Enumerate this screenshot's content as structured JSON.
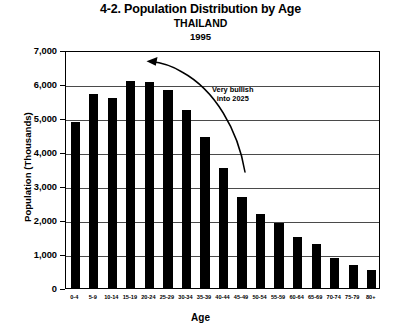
{
  "chart_data": {
    "type": "bar",
    "title": "4-2. Population Distribution by Age",
    "subtitle": "THAILAND",
    "subtitle2": "1995",
    "xlabel": "Age",
    "ylabel": "Population (Thousands)",
    "ylim": [
      0,
      7000
    ],
    "ytick_labels": [
      "7,000",
      "6,000",
      "5,000",
      "4,000",
      "3,000",
      "2,000",
      "1,000",
      "0"
    ],
    "ytick_values": [
      7000,
      6000,
      5000,
      4000,
      3000,
      2000,
      1000,
      0
    ],
    "grid": true,
    "legend": "none",
    "categories": [
      "0-4",
      "5-9",
      "10-14",
      "15-19",
      "20-24",
      "25-29",
      "30-34",
      "35-39",
      "40-44",
      "45-49",
      "50-54",
      "55-59",
      "60-64",
      "65-69",
      "70-74",
      "75-79",
      "80+"
    ],
    "values": [
      4880,
      5700,
      5580,
      6080,
      6050,
      5830,
      5250,
      4430,
      3520,
      2680,
      2180,
      1900,
      1500,
      1280,
      880,
      690,
      540
    ],
    "bar_color": "#000000",
    "annotations": [
      {
        "name": "very-bullish-note",
        "line1": "Very bullish",
        "line2": "into 2025",
        "arrow": "curved arrow pointing up-left toward younger age cohorts"
      }
    ]
  }
}
